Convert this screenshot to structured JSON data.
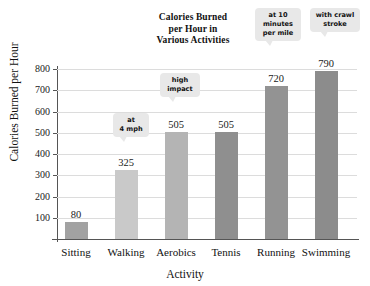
{
  "chart_data": {
    "type": "bar",
    "title": "Calories Burned per Hour in Various Activities",
    "title_lines": [
      "Calories Burned",
      "per Hour in",
      "Various Activities"
    ],
    "xlabel": "Activity",
    "ylabel": "Calories Burned per Hour",
    "categories": [
      "Sitting",
      "Walking",
      "Aerobics",
      "Tennis",
      "Running",
      "Swimming"
    ],
    "values": [
      80,
      325,
      505,
      505,
      720,
      790
    ],
    "value_labels": [
      "80",
      "325",
      "505",
      "505",
      "720",
      "790"
    ],
    "bar_colors": [
      "#a2a2a2",
      "#c9c9c9",
      "#b4b4b4",
      "#8f8f8f",
      "#939393",
      "#8c8c8c"
    ],
    "ylim": [
      0,
      800
    ],
    "yticks": [
      100,
      200,
      300,
      400,
      500,
      600,
      700,
      800
    ],
    "ytick_labels": [
      "100",
      "200",
      "300",
      "400",
      "500",
      "600",
      "700",
      "800"
    ],
    "grid": true,
    "legend": "none",
    "annotations": [
      {
        "text": "at 4 mph",
        "lines": [
          "at",
          "4 mph"
        ],
        "target": "Walking"
      },
      {
        "text": "high impact",
        "lines": [
          "high",
          "impact"
        ],
        "target": "Aerobics"
      },
      {
        "text": "at 10 minutes per mile",
        "lines": [
          "at 10",
          "minutes",
          "per mile"
        ],
        "target": "Running"
      },
      {
        "text": "with crawl stroke",
        "lines": [
          "with crawl",
          "stroke"
        ],
        "target": "Swimming"
      }
    ]
  }
}
